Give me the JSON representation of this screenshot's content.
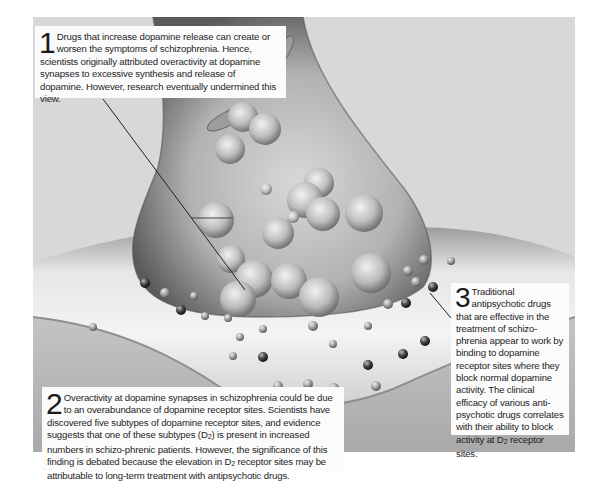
{
  "figure": {
    "colors": {
      "background": "#d9d9d9",
      "terminal": "#a8a8a8",
      "postsynaptic": "#cfcfcf",
      "callout_bg": "#fbfbfb",
      "text": "#1e1e1e",
      "leader_line": "#222222"
    }
  },
  "callouts": [
    {
      "number": "1",
      "text": "Drugs that increase dopamine release can create or worsen the symptoms of schizophrenia. Hence, scientists originally attributed overactivity at dopamine synapses to excessive synthesis and release of dopamine. However, research eventually undermined this view."
    },
    {
      "number": "2",
      "text_before_sub_1": "Overactivity at dopamine synapses in schizophrenia could be due to an overabundance of dopamine receptor sites. Scientists have discovered five subtypes of dopamine receptor sites, and evidence suggests that one of these subtypes (D",
      "sub_1": "2",
      "text_between": ") is present in increased numbers in schizo-phrenic patients. However, the significance of this finding is debated because the elevation in D",
      "sub_2": "2",
      "text_after": " receptor sites may be attributable to long-term treatment with antipsychotic drugs."
    },
    {
      "number": "3",
      "text_before_sub": "Traditional antipsychotic drugs that are effective in the treatment of schizo-phrenia appear to work by binding to dopamine receptor sites where they block normal dopamine activity. The clinical efficacy of various anti-psychotic drugs correlates with their ability to block activity at D",
      "sub": "2",
      "text_after": " receptor sites."
    }
  ]
}
